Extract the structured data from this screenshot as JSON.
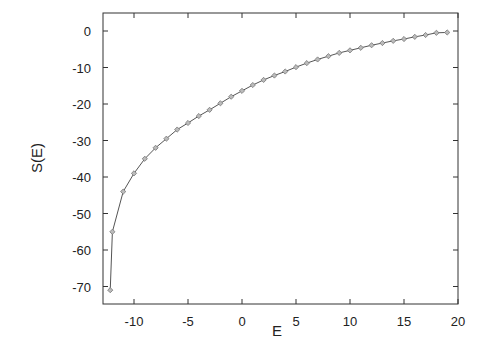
{
  "chart_data": {
    "type": "line",
    "title": "",
    "xlabel": "E",
    "ylabel": "S(E)",
    "xlim": [
      -13,
      20
    ],
    "ylim": [
      -75,
      5
    ],
    "xticks": [
      -10,
      -5,
      0,
      5,
      10,
      15,
      20
    ],
    "yticks": [
      0,
      -10,
      -20,
      -30,
      -40,
      -50,
      -60,
      -70
    ],
    "grid": false,
    "legend": null,
    "marker": "diamond",
    "series": [
      {
        "name": "S(E)",
        "x": [
          -12.2,
          -12,
          -11,
          -10,
          -9,
          -8,
          -7,
          -6,
          -5,
          -4,
          -3,
          -2,
          -1,
          0,
          1,
          2,
          3,
          4,
          5,
          6,
          7,
          8,
          9,
          10,
          11,
          12,
          13,
          14,
          15,
          16,
          17,
          18,
          19
        ],
        "y": [
          -71,
          -55,
          -44,
          -39,
          -35,
          -32,
          -29.5,
          -27,
          -25.2,
          -23.3,
          -21.6,
          -19.8,
          -18,
          -16.4,
          -14.8,
          -13.4,
          -12.2,
          -11.1,
          -9.9,
          -8.8,
          -7.8,
          -6.9,
          -6.0,
          -5.3,
          -4.6,
          -3.9,
          -3.3,
          -2.7,
          -2.2,
          -1.6,
          -1.1,
          -0.5,
          -0.4
        ]
      }
    ]
  },
  "colors": {
    "line": "#555555",
    "marker": "#777777",
    "axis": "#333333"
  }
}
